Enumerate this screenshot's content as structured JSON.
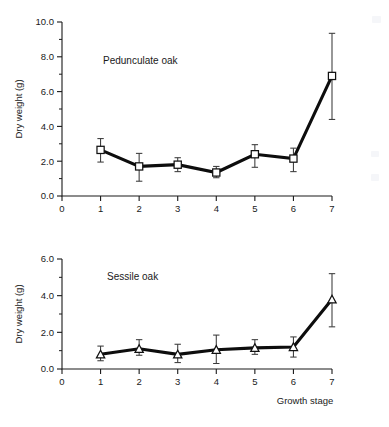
{
  "figure": {
    "background_color": "#ffffff",
    "line_color": "#0d0d0d",
    "marker_fill": "#ffffff",
    "error_bar_color": "#3a3a3a"
  },
  "chart_data": [
    {
      "type": "line",
      "title": "",
      "annotation": "Pedunculate oak",
      "marker": "square",
      "xlabel": "Growth stage",
      "ylabel": "Dry weight (g)",
      "x": [
        1,
        2,
        3,
        4,
        5,
        6,
        7
      ],
      "categories": [
        "1",
        "2",
        "3",
        "4",
        "5",
        "6",
        "7"
      ],
      "values": [
        2.65,
        1.7,
        1.8,
        1.35,
        2.4,
        2.15,
        6.9
      ],
      "err_low": [
        1.95,
        0.85,
        1.4,
        1.05,
        1.65,
        1.4,
        4.4
      ],
      "err_high": [
        3.3,
        2.45,
        2.2,
        1.7,
        2.95,
        2.75,
        9.35
      ],
      "xlim": [
        0,
        7
      ],
      "ylim": [
        0.0,
        10.0
      ],
      "xticks": [
        0,
        1,
        2,
        3,
        4,
        5,
        6,
        7
      ],
      "xticklabels": [
        "0",
        "1",
        "2",
        "3",
        "4",
        "5",
        "6",
        "7"
      ],
      "yticks": [
        0.0,
        2.0,
        4.0,
        6.0,
        8.0,
        10.0
      ],
      "yticklabels": [
        "0.0",
        "2.0",
        "4.0",
        "6.0",
        "8.0",
        "10.0"
      ],
      "y_minor_ticks": [
        1.0,
        3.0,
        5.0,
        7.0,
        9.0
      ],
      "grid": false,
      "legend": "none"
    },
    {
      "type": "line",
      "title": "",
      "annotation": "Sessile oak",
      "marker": "triangle",
      "xlabel": "Growth stage",
      "ylabel": "Dry weight (g)",
      "x": [
        1,
        2,
        3,
        4,
        5,
        6,
        7
      ],
      "categories": [
        "1",
        "2",
        "3",
        "4",
        "5",
        "6",
        "7"
      ],
      "values": [
        0.8,
        1.1,
        0.8,
        1.05,
        1.15,
        1.2,
        3.8
      ],
      "err_low": [
        0.45,
        0.75,
        0.35,
        0.3,
        0.8,
        0.65,
        2.3
      ],
      "err_high": [
        1.25,
        1.6,
        1.35,
        1.85,
        1.6,
        1.75,
        5.2
      ],
      "xlim": [
        0,
        7
      ],
      "ylim": [
        0.0,
        6.0
      ],
      "xticks": [
        0,
        1,
        2,
        3,
        4,
        5,
        6,
        7
      ],
      "xticklabels": [
        "0",
        "1",
        "2",
        "3",
        "4",
        "5",
        "6",
        "7"
      ],
      "yticks": [
        0.0,
        2.0,
        4.0,
        6.0
      ],
      "yticklabels": [
        "0.0",
        "2.0",
        "4.0",
        "6.0"
      ],
      "y_minor_ticks": [
        1.0,
        3.0,
        5.0
      ],
      "grid": false,
      "legend": "none"
    }
  ]
}
